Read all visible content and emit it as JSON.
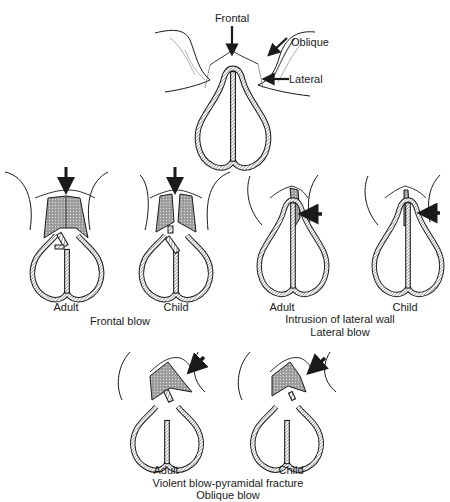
{
  "figure": {
    "top_diagram": {
      "labels": {
        "frontal": "Frontal",
        "oblique": "Oblique",
        "lateral": "Lateral"
      }
    },
    "panels": [
      {
        "group": "frontal_blow",
        "items": [
          {
            "label": "Adult"
          },
          {
            "label": "Child"
          }
        ],
        "caption": "Frontal blow"
      },
      {
        "group": "lateral_blow",
        "items": [
          {
            "label": "Adult"
          },
          {
            "label": "Child"
          }
        ],
        "caption_line1": "Intrusion of lateral wall",
        "caption_line2": "Lateral blow"
      },
      {
        "group": "oblique_blow",
        "items": [
          {
            "label": "Adult"
          },
          {
            "label": "Child"
          }
        ],
        "caption_line1": "Violent blow-pyramidal fracture",
        "caption_line2": "Oblique blow"
      }
    ]
  },
  "colors": {
    "ink": "#1a1a1a",
    "background": "#ffffff",
    "hatch": "#7a7a7a"
  }
}
